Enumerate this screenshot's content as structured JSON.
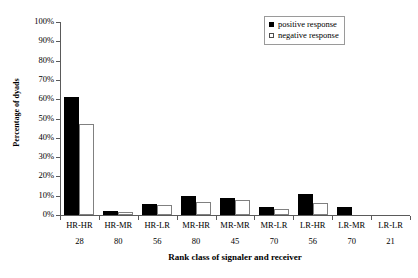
{
  "chart_data": {
    "type": "bar",
    "title": "",
    "xlabel": "Rank class of signaler and receiver",
    "ylabel": "Percentage of dyads",
    "ylim": [
      0,
      100
    ],
    "ytick_labels": [
      "0%",
      "10%",
      "20%",
      "30%",
      "40%",
      "50%",
      "60%",
      "70%",
      "80%",
      "90%",
      "100%"
    ],
    "ytick_values": [
      0,
      10,
      20,
      30,
      40,
      50,
      60,
      70,
      80,
      90,
      100
    ],
    "grid": false,
    "legend_position": "top-right",
    "categories": [
      "HR-HR",
      "HR-MR",
      "HR-LR",
      "MR-HR",
      "MR-MR",
      "MR-LR",
      "LR-HR",
      "LR-MR",
      "LR-LR"
    ],
    "category_counts": [
      "28",
      "80",
      "56",
      "80",
      "45",
      "70",
      "56",
      "70",
      "21"
    ],
    "series": [
      {
        "name": "positive response",
        "color": "#000000",
        "values": [
          61,
          2,
          5.5,
          10,
          9,
          4,
          11,
          4,
          0
        ]
      },
      {
        "name": "negative response",
        "color": "#ffffff",
        "values": [
          47,
          1.5,
          5,
          7,
          8,
          3,
          6,
          0,
          0
        ]
      }
    ]
  },
  "legend": {
    "items": [
      {
        "label": "positive response",
        "swatch": "filled-black-square"
      },
      {
        "label": "negative response",
        "swatch": "open-white-square"
      }
    ]
  },
  "axes": {
    "y_title": "Percentage of dyads",
    "x_title": "Rank class of signaler and receiver"
  }
}
